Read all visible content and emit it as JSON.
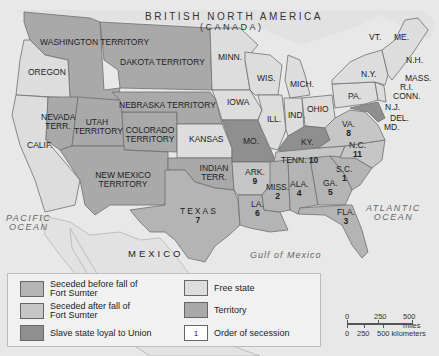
{
  "map": {
    "title": "BRITISH NORTH AMERICA",
    "subtitle": "(CANADA)",
    "colors": {
      "ocean": "#e8e8e8",
      "seceded_before": "#b4b4b4",
      "seceded_after": "#c6c6c6",
      "slave_loyal": "#8f8f8f",
      "free_state": "#dddddd",
      "territory": "#a9a9a9",
      "foreign": "#e2e2e2"
    },
    "regions": [
      {
        "name": "WASHINGTON TERRITORY",
        "category": "territory"
      },
      {
        "name": "OREGON",
        "category": "free_state"
      },
      {
        "name": "CALIF.",
        "category": "free_state"
      },
      {
        "name": "NEVADA TERR.",
        "category": "territory"
      },
      {
        "name": "UTAH TERRITORY",
        "category": "territory"
      },
      {
        "name": "COLORADO TERRITORY",
        "category": "territory"
      },
      {
        "name": "DAKOTA TERRITORY",
        "category": "territory"
      },
      {
        "name": "NEBRASKA TERRITORY",
        "category": "territory"
      },
      {
        "name": "NEW MEXICO TERRITORY",
        "category": "territory"
      },
      {
        "name": "INDIAN TERR.",
        "category": "territory"
      },
      {
        "name": "KANSAS",
        "category": "free_state"
      },
      {
        "name": "MINN.",
        "category": "free_state"
      },
      {
        "name": "IOWA",
        "category": "free_state"
      },
      {
        "name": "WIS.",
        "category": "free_state"
      },
      {
        "name": "MICH.",
        "category": "free_state"
      },
      {
        "name": "ILL.",
        "category": "free_state"
      },
      {
        "name": "IND.",
        "category": "free_state"
      },
      {
        "name": "OHIO",
        "category": "free_state"
      },
      {
        "name": "PA.",
        "category": "free_state"
      },
      {
        "name": "N.Y.",
        "category": "free_state"
      },
      {
        "name": "VT.",
        "category": "free_state"
      },
      {
        "name": "ME.",
        "category": "free_state"
      },
      {
        "name": "N.H.",
        "category": "free_state"
      },
      {
        "name": "MASS.",
        "category": "free_state"
      },
      {
        "name": "R.I.",
        "category": "free_state"
      },
      {
        "name": "CONN.",
        "category": "free_state"
      },
      {
        "name": "N.J.",
        "category": "free_state"
      },
      {
        "name": "DEL.",
        "category": "slave_loyal"
      },
      {
        "name": "MD.",
        "category": "slave_loyal"
      },
      {
        "name": "MO.",
        "category": "slave_loyal"
      },
      {
        "name": "KY.",
        "category": "slave_loyal"
      },
      {
        "name": "VA.",
        "category": "seceded_after",
        "order": "8"
      },
      {
        "name": "N.C.",
        "category": "seceded_after",
        "order": "11"
      },
      {
        "name": "TENN.",
        "category": "seceded_after",
        "order": "10"
      },
      {
        "name": "ARK.",
        "category": "seceded_after",
        "order": "9"
      },
      {
        "name": "S.C.",
        "category": "seceded_before",
        "order": "1"
      },
      {
        "name": "MISS.",
        "category": "seceded_before",
        "order": "2"
      },
      {
        "name": "FLA.",
        "category": "seceded_before",
        "order": "3"
      },
      {
        "name": "ALA.",
        "category": "seceded_before",
        "order": "4"
      },
      {
        "name": "GA.",
        "category": "seceded_before",
        "order": "5"
      },
      {
        "name": "LA.",
        "category": "seceded_before",
        "order": "6"
      },
      {
        "name": "TEXAS",
        "category": "seceded_before",
        "order": "7"
      }
    ],
    "water": {
      "pacific_1": "PACIFIC",
      "pacific_2": "OCEAN",
      "atlantic_1": "ATLANTIC",
      "atlantic_2": "OCEAN",
      "gulf": "Gulf of Mexico"
    },
    "foreign": {
      "mexico": "MEXICO"
    }
  },
  "legend": {
    "items": [
      {
        "label_1": "Seceded before fall of",
        "label_2": "Fort Sumter",
        "color": "#b4b4b4"
      },
      {
        "label_1": "Seceded after fall of",
        "label_2": "Fort Sumter",
        "color": "#c6c6c6"
      },
      {
        "label_1": "Slave state loyal to Union",
        "color": "#8f8f8f"
      },
      {
        "label_1": "Free state",
        "color": "#dddddd"
      },
      {
        "label_1": "Territory",
        "color": "#a9a9a9"
      },
      {
        "label_1": "Order of secession",
        "sample": "1"
      }
    ]
  },
  "scale_bar": {
    "miles": [
      "0",
      "250",
      "500 miles"
    ],
    "kilometers": [
      "0",
      "250",
      "500 kilometers"
    ]
  }
}
